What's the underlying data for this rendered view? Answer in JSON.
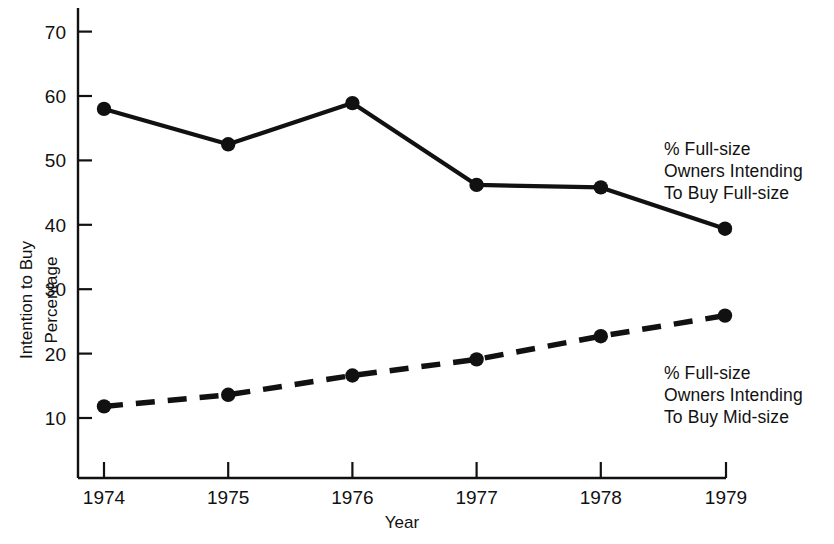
{
  "chart_data": {
    "type": "line",
    "title": "",
    "xlabel": "Year",
    "ylabel": "Intention to Buy Percentage",
    "ylabel_lines": [
      "Intention to Buy",
      "Percentage"
    ],
    "categories": [
      "1974",
      "1975",
      "1976",
      "1977",
      "1978",
      "1979"
    ],
    "x": [
      1974,
      1975,
      1976,
      1977,
      1978,
      1979
    ],
    "xlim": [
      1973.78,
      1979.0
    ],
    "ylim": [
      5.6,
      73.5
    ],
    "yticks": [
      10,
      20,
      30,
      40,
      50,
      60,
      70
    ],
    "ytick_labels": [
      "10",
      "20",
      "30",
      "40",
      "50",
      "60",
      "70"
    ],
    "grid": false,
    "legend_position": "right-inline",
    "series": [
      {
        "name": "% Full-size Owners Intending To Buy Full-size",
        "label_lines": [
          "% Full-size",
          "Owners Intending",
          "To Buy Full-size"
        ],
        "style": "solid",
        "color": "#111111",
        "marker": "circle",
        "values": [
          58.0,
          52.5,
          58.9,
          46.2,
          45.8,
          39.4
        ]
      },
      {
        "name": "% Full-size Owners Intending To Buy Mid-size",
        "label_lines": [
          "% Full-size",
          "Owners Intending",
          "To Buy Mid-size"
        ],
        "style": "dashed",
        "color": "#111111",
        "marker": "circle",
        "values": [
          11.8,
          13.6,
          16.6,
          19.1,
          22.7,
          25.9
        ]
      }
    ]
  },
  "axis": {
    "y_title_line1": "Intention to Buy",
    "y_title_line2": "Percentage",
    "x_title": "Year",
    "y_ticks": [
      {
        "label": "70"
      },
      {
        "label": "60"
      },
      {
        "label": "50"
      },
      {
        "label": "40"
      },
      {
        "label": "30"
      },
      {
        "label": "20"
      },
      {
        "label": "10"
      }
    ],
    "x_ticks": [
      {
        "label": "1974"
      },
      {
        "label": "1975"
      },
      {
        "label": "1976"
      },
      {
        "label": "1977"
      },
      {
        "label": "1978"
      },
      {
        "label": "1979"
      }
    ]
  },
  "legend": {
    "upper": {
      "line1": "% Full-size",
      "line2": "Owners Intending",
      "line3": "To Buy Full-size"
    },
    "lower": {
      "line1": "% Full-size",
      "line2": "Owners Intending",
      "line3": "To Buy Mid-size"
    }
  },
  "colors": {
    "ink": "#111111",
    "background": "#ffffff"
  }
}
